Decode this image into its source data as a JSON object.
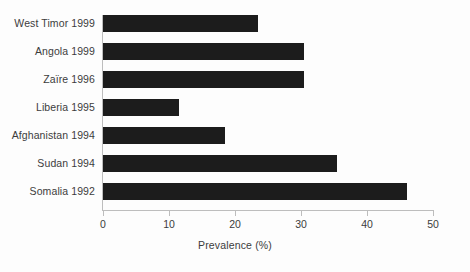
{
  "chart_data": {
    "type": "bar",
    "orientation": "horizontal",
    "title": "",
    "subtitle": "",
    "xlabel": "Prevalence (%)",
    "ylabel": "",
    "xlim": [
      0,
      50
    ],
    "xticks": [
      0,
      10,
      20,
      30,
      40,
      50
    ],
    "xtick_labels": [
      "0",
      "10",
      "20",
      "30",
      "40",
      "50"
    ],
    "grid": false,
    "legend": false,
    "legend_position": "none",
    "categories": [
      "West Timor 1999",
      "Angola 1999",
      "Zaïre 1996",
      "Liberia 1995",
      "Afghanistan 1994",
      "Sudan 1994",
      "Somalia 1992"
    ],
    "values": [
      23.5,
      30.5,
      30.5,
      11.5,
      18.5,
      35.5,
      46.0
    ],
    "series": [
      {
        "name": "Prevalence (%)",
        "values": [
          23.5,
          30.5,
          30.5,
          11.5,
          18.5,
          35.5,
          46.0
        ]
      }
    ],
    "bar_color": "#1c1c1c",
    "axis_color": "#bdbdbd",
    "text_color": "#3c3c3c",
    "background_color": "#fdfdfd"
  }
}
